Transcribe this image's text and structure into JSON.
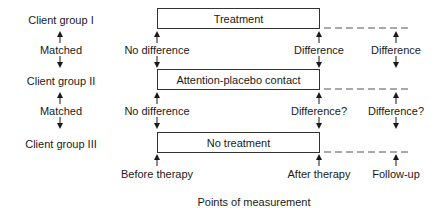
{
  "groups": [
    {
      "label": "Client group I",
      "condition": "Treatment"
    },
    {
      "label": "Client group II",
      "condition": "Attention-placebo contact"
    },
    {
      "label": "Client group III",
      "condition": "No treatment"
    }
  ],
  "matched_label": "Matched",
  "comparisons_row1": {
    "before": "No difference",
    "after": "Difference",
    "followup": "Difference"
  },
  "comparisons_row2": {
    "before": "No difference",
    "after": "Difference?",
    "followup": "Difference?"
  },
  "time_points": {
    "before": "Before therapy",
    "after": "After therapy",
    "followup": "Follow-up"
  },
  "axis_caption": "Points of measurement"
}
